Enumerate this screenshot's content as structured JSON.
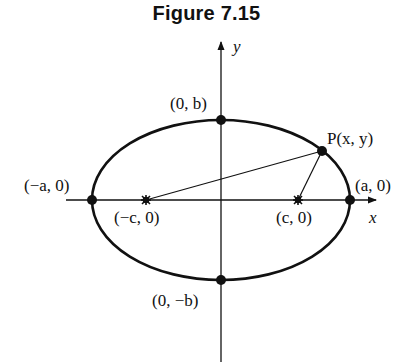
{
  "figure": {
    "title": "Figure 7.15",
    "axes": {
      "x_label": "x",
      "y_label": "y"
    },
    "points": {
      "vertex_left": "(−a, 0)",
      "vertex_right": "(a, 0)",
      "covertex_top": "(0, b)",
      "covertex_bottom": "(0, −b)",
      "focus_left": "(−c, 0)",
      "focus_right": "(c, 0)",
      "point_p": "P(x, y)"
    }
  }
}
